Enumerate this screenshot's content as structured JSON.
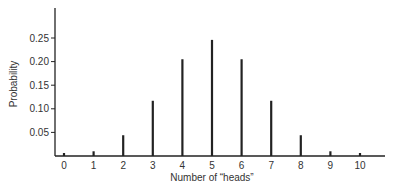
{
  "chart_data": {
    "type": "bar",
    "title": "",
    "xlabel": "Number of “heads”",
    "ylabel": "Probability",
    "categories": [
      "0",
      "1",
      "2",
      "3",
      "4",
      "5",
      "6",
      "7",
      "8",
      "9",
      "10"
    ],
    "values": [
      0.001,
      0.01,
      0.044,
      0.117,
      0.205,
      0.246,
      0.205,
      0.117,
      0.044,
      0.01,
      0.001
    ],
    "yticks": [
      "0.05",
      "0.10",
      "0.15",
      "0.20",
      "0.25"
    ],
    "ylim": [
      0,
      0.3
    ],
    "grid": false,
    "legend": null,
    "bar_style": "thin vertical lines (spike plot)"
  },
  "colors": {
    "bar": "#222222",
    "axis": "#222222",
    "text": "#333333"
  }
}
